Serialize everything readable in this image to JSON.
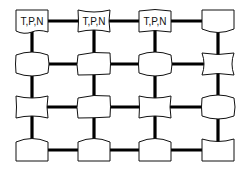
{
  "diagram": {
    "type": "2D mesh grid of nodes",
    "rows": 4,
    "cols": 4,
    "colors": {
      "stroke": "#111111",
      "fill": "#ffffff",
      "edge": "#000000"
    },
    "labeled_nodes_text": "T,P,N",
    "nodes": [
      {
        "id": "r1c1",
        "row": 1,
        "col": 1,
        "label": "T,P,N",
        "cx": 32,
        "cy": 21,
        "shape": "wavy-bottom"
      },
      {
        "id": "r1c2",
        "row": 1,
        "col": 2,
        "label": "T,P,N",
        "cx": 94,
        "cy": 21,
        "shape": "concave"
      },
      {
        "id": "r1c3",
        "row": 1,
        "col": 3,
        "label": "T,P,N",
        "cx": 155,
        "cy": 21,
        "shape": "wavy"
      },
      {
        "id": "r1c4",
        "row": 1,
        "col": 4,
        "label": "",
        "cx": 218,
        "cy": 21,
        "shape": "convex-bottom"
      },
      {
        "id": "r2c1",
        "row": 2,
        "col": 1,
        "label": "",
        "cx": 32,
        "cy": 64,
        "shape": "barrel"
      },
      {
        "id": "r2c2",
        "row": 2,
        "col": 2,
        "label": "",
        "cx": 94,
        "cy": 64,
        "shape": "skew"
      },
      {
        "id": "r2c3",
        "row": 2,
        "col": 3,
        "label": "",
        "cx": 155,
        "cy": 64,
        "shape": "barrel"
      },
      {
        "id": "r2c4",
        "row": 2,
        "col": 4,
        "label": "",
        "cx": 218,
        "cy": 64,
        "shape": "hourglass"
      },
      {
        "id": "r3c1",
        "row": 3,
        "col": 1,
        "label": "",
        "cx": 32,
        "cy": 107,
        "shape": "concave"
      },
      {
        "id": "r3c2",
        "row": 3,
        "col": 2,
        "label": "",
        "cx": 94,
        "cy": 107,
        "shape": "skew"
      },
      {
        "id": "r3c3",
        "row": 3,
        "col": 3,
        "label": "",
        "cx": 155,
        "cy": 107,
        "shape": "concave"
      },
      {
        "id": "r3c4",
        "row": 3,
        "col": 4,
        "label": "",
        "cx": 218,
        "cy": 107,
        "shape": "barrel"
      },
      {
        "id": "r4c1",
        "row": 4,
        "col": 1,
        "label": "",
        "cx": 32,
        "cy": 150,
        "shape": "convex-top"
      },
      {
        "id": "r4c2",
        "row": 4,
        "col": 2,
        "label": "",
        "cx": 94,
        "cy": 150,
        "shape": "convex-top"
      },
      {
        "id": "r4c3",
        "row": 4,
        "col": 3,
        "label": "",
        "cx": 155,
        "cy": 150,
        "shape": "convex-top"
      },
      {
        "id": "r4c4",
        "row": 4,
        "col": 4,
        "label": "",
        "cx": 218,
        "cy": 150,
        "shape": "concave-top"
      }
    ]
  }
}
